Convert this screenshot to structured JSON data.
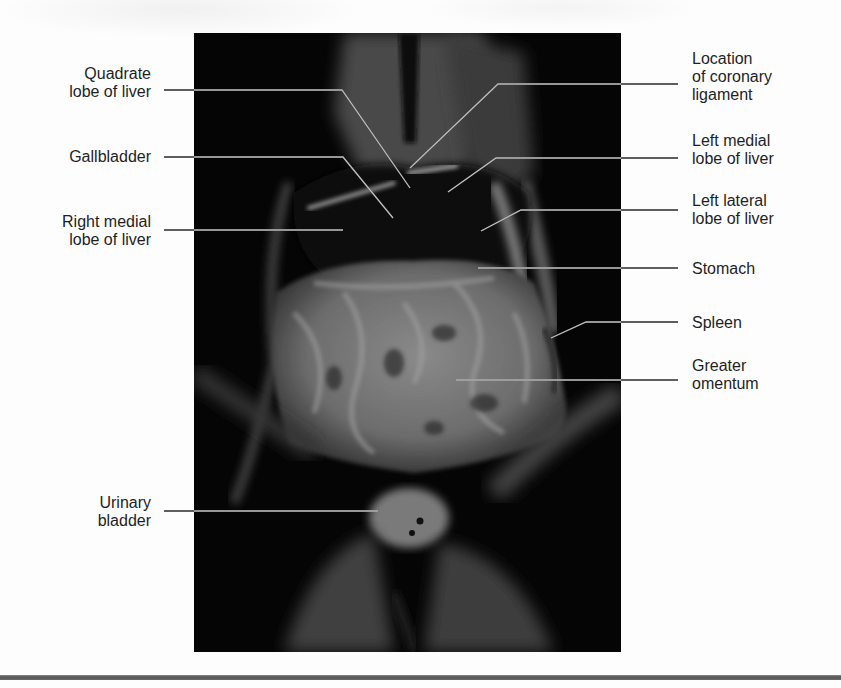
{
  "figure": {
    "colors": {
      "background": "#fdfdfd",
      "photo_background": "#050505",
      "leader_line_outside": "#222222",
      "leader_line_inside": "#bfbfbf",
      "label_text": "#1f1f1f",
      "bottom_rule": "#5e5e5e"
    }
  },
  "labels": {
    "left": [
      {
        "id": "quadrate",
        "text": "Quadrate\nlobe of liver"
      },
      {
        "id": "gallbladder",
        "text": "Gallbladder"
      },
      {
        "id": "right_medial",
        "text": "Right medial\nlobe of liver"
      },
      {
        "id": "urinary_bladder",
        "text": "Urinary\nbladder"
      }
    ],
    "right": [
      {
        "id": "coronary",
        "text": "Location\nof coronary\nligament"
      },
      {
        "id": "left_medial",
        "text": "Left medial\nlobe of liver"
      },
      {
        "id": "left_lateral",
        "text": "Left lateral\nlobe of liver"
      },
      {
        "id": "stomach",
        "text": "Stomach"
      },
      {
        "id": "spleen",
        "text": "Spleen"
      },
      {
        "id": "greater_omentum",
        "text": "Greater\nomentum"
      }
    ]
  }
}
